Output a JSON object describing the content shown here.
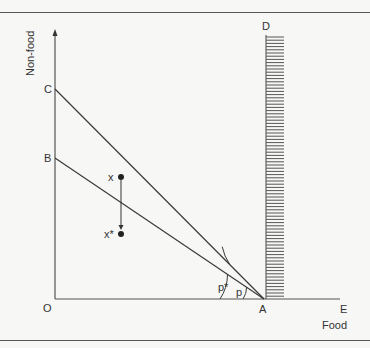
{
  "figure": {
    "axis_labels": {
      "x": "Food",
      "y": "Non-food"
    },
    "points": {
      "origin": "O",
      "A": "A",
      "B": "B",
      "C": "C",
      "D": "D",
      "E": "E",
      "x": "x",
      "x_star": "x*"
    },
    "angles": {
      "p": "p",
      "p_star": "p*"
    },
    "colors": {
      "line": "#3a3a3a",
      "background": "#f7f7f5",
      "border": "#555555"
    }
  }
}
